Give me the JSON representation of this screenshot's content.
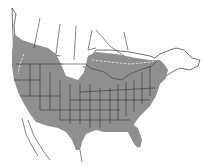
{
  "map": {
    "region": "North America (USA, southern Canada, northern Mexico)",
    "type": "species range map",
    "colors": {
      "range_fill": "#8f8f8f",
      "background": "#ffffff",
      "outline": "#333333",
      "boundary_dashed": "#e8e8e8"
    },
    "legend": []
  }
}
